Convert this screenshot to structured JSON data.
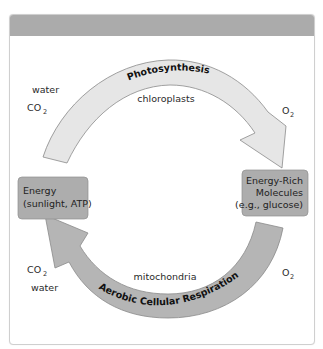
{
  "diagram": {
    "colors": {
      "header_band": "#ababab",
      "box_fill": "#adadad",
      "photosynthesis_arrow": "#e6e6e6",
      "respiration_arrow": "#b5b5b5",
      "outline": "#8a8a8a"
    },
    "boxes": {
      "left": {
        "line1": "Energy",
        "line2": "(sunlight, ATP)"
      },
      "right": {
        "line1": "Energy-Rich",
        "line2": "Molecules",
        "line3": "(e.g., glucose)"
      }
    },
    "top_arrow": {
      "label": "Photosynthesis",
      "location": "chloroplasts",
      "inputs": {
        "water": "water",
        "co2_main": "CO",
        "co2_sub": "2"
      },
      "outputs": {
        "o2_main": "O",
        "o2_sub": "2"
      }
    },
    "bottom_arrow": {
      "label": "Aerobic Cellular Respiration",
      "location": "mitochondria",
      "inputs": {
        "o2_main": "O",
        "o2_sub": "2"
      },
      "outputs": {
        "co2_main": "CO",
        "co2_sub": "2",
        "water": "water"
      }
    }
  }
}
